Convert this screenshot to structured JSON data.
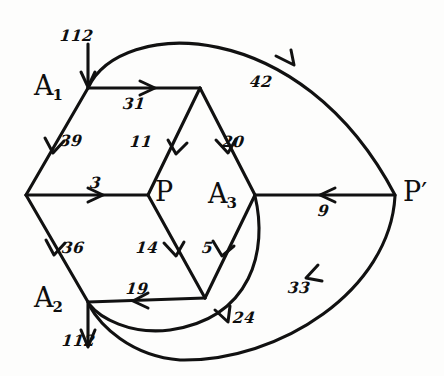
{
  "diagram": {
    "ink_color": "#111111",
    "background_color": "#fdfdfc",
    "nodes": [
      {
        "id": "A1",
        "label": "A",
        "subscript": "1",
        "x": 88,
        "y": 88
      },
      {
        "id": "A2",
        "label": "A",
        "subscript": "2",
        "x": 88,
        "y": 302
      },
      {
        "id": "A3",
        "label": "A",
        "subscript": "3",
        "x": 255,
        "y": 195
      },
      {
        "id": "P",
        "label": "P",
        "subscript": "",
        "x": 148,
        "y": 195
      },
      {
        "id": "Pprime",
        "label": "P",
        "subscript": "",
        "prime": "′",
        "x": 395,
        "y": 195
      },
      {
        "id": "L",
        "label": "",
        "subscript": "",
        "x": 26,
        "y": 195
      },
      {
        "id": "T",
        "label": "",
        "subscript": "",
        "x": 200,
        "y": 88
      },
      {
        "id": "B",
        "label": "",
        "subscript": "",
        "x": 205,
        "y": 298
      }
    ],
    "node_labels": [
      {
        "name": "node-label-a1",
        "text": "A",
        "sub": "1",
        "x": 34,
        "y": 72
      },
      {
        "name": "node-label-a2",
        "text": "A",
        "sub": "2",
        "x": 34,
        "y": 284
      },
      {
        "name": "node-label-a3",
        "text": "A",
        "sub": "3",
        "x": 208,
        "y": 180
      },
      {
        "name": "node-label-p",
        "text": "P",
        "sub": "",
        "x": 155,
        "y": 178
      },
      {
        "name": "node-label-pprime",
        "text": "P",
        "sub": "",
        "prime": "′",
        "x": 403,
        "y": 178
      }
    ],
    "edges": [
      {
        "id": "supply-in-a1",
        "label": "112",
        "from": "source",
        "to": "A1",
        "label_x": 60,
        "label_y": 28
      },
      {
        "id": "a1-to-top",
        "label": "31",
        "from": "A1",
        "to": "T",
        "label_x": 123,
        "label_y": 96
      },
      {
        "id": "a1-to-left",
        "label": "39",
        "from": "A1",
        "to": "L",
        "label_x": 60,
        "label_y": 133
      },
      {
        "id": "top-to-p",
        "label": "11",
        "from": "T",
        "to": "P",
        "label_x": 130,
        "label_y": 134
      },
      {
        "id": "top-to-a3",
        "label": "20",
        "from": "T",
        "to": "A3",
        "label_x": 222,
        "label_y": 134
      },
      {
        "id": "a1-arc-pprime",
        "label": "42",
        "from": "A1",
        "to": "Pprime",
        "label_x": 250,
        "label_y": 74
      },
      {
        "id": "left-to-p",
        "label": "3",
        "from": "L",
        "to": "P",
        "label_x": 90,
        "label_y": 175
      },
      {
        "id": "left-to-a2",
        "label": "36",
        "from": "L",
        "to": "A2",
        "label_x": 62,
        "label_y": 240
      },
      {
        "id": "p-to-bottom",
        "label": "14",
        "from": "P",
        "to": "B",
        "label_x": 136,
        "label_y": 240
      },
      {
        "id": "a3-to-bottom",
        "label": "5",
        "from": "A3",
        "to": "B",
        "label_x": 202,
        "label_y": 240
      },
      {
        "id": "pprime-to-a3",
        "label": "9",
        "from": "Pprime",
        "to": "A3",
        "label_x": 318,
        "label_y": 203
      },
      {
        "id": "bottom-to-a2",
        "label": "19",
        "from": "B",
        "to": "A2",
        "label_x": 126,
        "label_y": 281
      },
      {
        "id": "a3-arc-a2",
        "label": "24",
        "from": "A3",
        "to": "A2",
        "label_x": 233,
        "label_y": 310
      },
      {
        "id": "pprime-arc-a2",
        "label": "33",
        "from": "Pprime",
        "to": "A2",
        "label_x": 288,
        "label_y": 280
      },
      {
        "id": "demand-out-a2",
        "label": "112",
        "from": "A2",
        "to": "sink",
        "label_x": 62,
        "label_y": 333
      }
    ]
  }
}
